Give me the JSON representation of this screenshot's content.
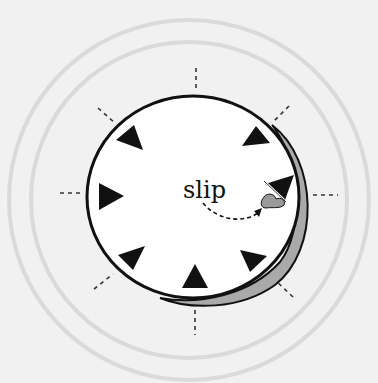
{
  "diagram": {
    "label": "slip",
    "colors": {
      "background": "#f1f1f1",
      "rings": "#dadada",
      "disk_fill": "#ffffff",
      "disk_stroke": "#111111",
      "shadow": "#a9a9a9",
      "triangle": "#111111",
      "smudge": "#9a9a9a",
      "ticks": "#333333"
    },
    "markers": {
      "count": 8,
      "positions": [
        "top-left",
        "left",
        "bottom-left",
        "bottom",
        "bottom-right",
        "right-slipped",
        "top-right"
      ]
    }
  }
}
